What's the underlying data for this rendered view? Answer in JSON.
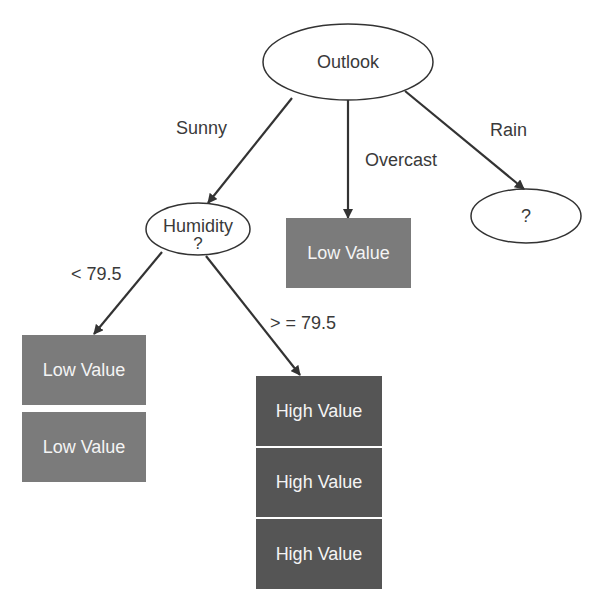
{
  "colors": {
    "edge": "#333333",
    "low_box": "#7b7b7b",
    "high_box": "#555555",
    "node_stroke": "#333333"
  },
  "nodes": {
    "root": {
      "label": "Outlook"
    },
    "humidity": {
      "label": "Humidity",
      "sub": "?"
    },
    "rain": {
      "label": "?"
    }
  },
  "edges": {
    "sunny": "Sunny",
    "overcast": "Overcast",
    "rain": "Rain",
    "lt": "< 79.5",
    "ge": "> = 79.5"
  },
  "leaves": {
    "overcast": [
      "Low Value"
    ],
    "humidity_low": [
      "Low Value",
      "Low Value"
    ],
    "humidity_high": [
      "High Value",
      "High Value",
      "High Value"
    ]
  }
}
